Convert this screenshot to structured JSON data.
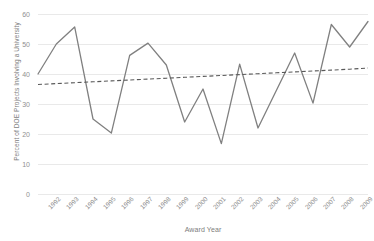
{
  "chart_data": {
    "type": "line",
    "title": "",
    "xlabel": "Award Year",
    "ylabel": "Percent of DOE Projects Involving a University",
    "categories": [
      "1992",
      "1993",
      "1994",
      "1995",
      "1996",
      "1997",
      "1998",
      "1999",
      "2000",
      "2001",
      "2002",
      "2003",
      "2004",
      "2005",
      "2006",
      "2007",
      "2008",
      "2009",
      "2010"
    ],
    "x": [
      1992,
      1993,
      1994,
      1995,
      1996,
      1997,
      1998,
      1999,
      2000,
      2001,
      2002,
      2003,
      2004,
      2005,
      2006,
      2007,
      2008,
      2009,
      2010
    ],
    "ylim": [
      0,
      60
    ],
    "yticks": [
      0,
      10,
      20,
      30,
      40,
      50,
      60
    ],
    "ytick_labels": [
      "0",
      "10",
      "20",
      "30",
      "40",
      "50",
      "60"
    ],
    "grid": "horizontal",
    "legend": "none",
    "series": [
      {
        "name": "Percent of DOE Projects Involving a University",
        "style": "solid",
        "color": "#808080",
        "values": [
          40.0,
          50.0,
          55.7,
          25.0,
          20.3,
          46.2,
          50.3,
          43.0,
          24.0,
          35.0,
          16.8,
          43.3,
          22.0,
          34.5,
          47.0,
          30.3,
          56.5,
          49.0,
          57.5
        ]
      },
      {
        "name": "Linear trendline",
        "style": "dashed",
        "color": "#595959",
        "values": [
          36.5,
          36.8,
          37.1,
          37.4,
          37.7,
          38.0,
          38.3,
          38.6,
          38.9,
          39.2,
          39.5,
          39.8,
          40.1,
          40.4,
          40.7,
          41.0,
          41.3,
          41.6,
          42.0
        ]
      }
    ]
  },
  "axes": {
    "y_title": "Percent of DOE Projects Involving a University",
    "x_title": "Award Year"
  }
}
